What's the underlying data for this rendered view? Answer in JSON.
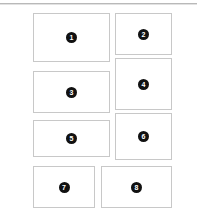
{
  "page": {
    "background_color": "#ffffff",
    "width": 197,
    "height": 219
  },
  "divider": {
    "name": "top-rule",
    "color": "#b9b9b9"
  },
  "style": {
    "box_border_color": "#c8c8c8",
    "box_fill_color": "#ffffff",
    "badge_fill_color": "#111111",
    "badge_text_color": "#ffffff"
  },
  "boxes": [
    {
      "label": "1",
      "x": 33,
      "y": 13,
      "w": 77,
      "h": 49
    },
    {
      "label": "2",
      "x": 115,
      "y": 13,
      "w": 57,
      "h": 42
    },
    {
      "label": "3",
      "x": 33,
      "y": 71,
      "w": 77,
      "h": 42
    },
    {
      "label": "4",
      "x": 115,
      "y": 58,
      "w": 57,
      "h": 52
    },
    {
      "label": "5",
      "x": 33,
      "y": 120,
      "w": 77,
      "h": 37
    },
    {
      "label": "6",
      "x": 115,
      "y": 113,
      "w": 57,
      "h": 47
    },
    {
      "label": "7",
      "x": 33,
      "y": 166,
      "w": 62,
      "h": 42
    },
    {
      "label": "8",
      "x": 101,
      "y": 166,
      "w": 71,
      "h": 42
    }
  ]
}
